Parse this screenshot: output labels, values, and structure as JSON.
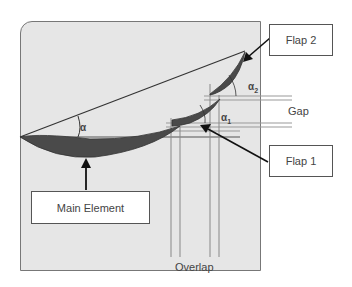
{
  "diagram": {
    "type": "multi-element airfoil schematic",
    "labels": {
      "main_element": "Main Element",
      "flap1": "Flap 1",
      "flap2": "Flap 2",
      "gap": "Gap",
      "overlap": "Overlap"
    },
    "angles": {
      "alpha": "α",
      "alpha1": "α",
      "alpha1_sub": "1",
      "alpha2": "α",
      "alpha2_sub": "2"
    },
    "colors": {
      "panel_bg": "#e6e6e6",
      "airfoil_fill": "#4a4a4a",
      "line": "#333333",
      "guide_line": "#888888"
    }
  }
}
